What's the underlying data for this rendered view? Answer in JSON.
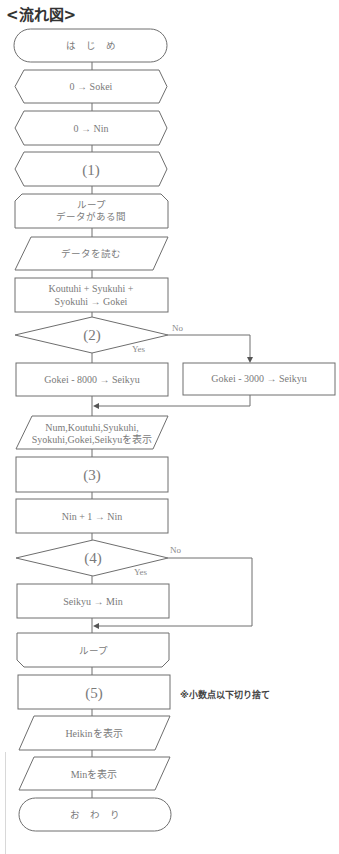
{
  "title": "<流れ図>",
  "nodes": {
    "start": {
      "type": "terminal",
      "label": "は　じ　め"
    },
    "init_sokei": {
      "type": "preparation",
      "label": "0 → Sokei"
    },
    "init_nin": {
      "type": "preparation",
      "label": "0 → Nin"
    },
    "blank1": {
      "type": "preparation",
      "label": "(1)"
    },
    "loop_start": {
      "type": "loop-start",
      "line1": "ループ",
      "line2": "データがある間"
    },
    "read_data": {
      "type": "input",
      "label": "データを読む"
    },
    "sum_gokei": {
      "type": "process",
      "line1": "Koutuhi + Syukuhi +",
      "line2": "Syokuhi → Gokei"
    },
    "blank2": {
      "type": "decision",
      "label": "(2)",
      "yes": "Yes",
      "no": "No"
    },
    "seikyu_8000": {
      "type": "process",
      "label": "Gokei - 8000 → Seikyu"
    },
    "seikyu_3000": {
      "type": "process",
      "label": "Gokei - 3000 → Seikyu"
    },
    "display_record": {
      "type": "output",
      "line1": "Num,Koutuhi,Syukuhi,",
      "line2": "Syokuhi,Gokei,Seikyuを表示"
    },
    "blank3": {
      "type": "process",
      "label": "(3)"
    },
    "inc_nin": {
      "type": "process",
      "label": "Nin + 1 → Nin"
    },
    "blank4": {
      "type": "decision",
      "label": "(4)",
      "yes": "Yes",
      "no": "No"
    },
    "set_min": {
      "type": "process",
      "label": "Seikyu → Min"
    },
    "loop_end": {
      "type": "loop-end",
      "label": "ループ"
    },
    "blank5": {
      "type": "process",
      "label": "(5)",
      "note": "※小数点以下切り捨て"
    },
    "display_heikin": {
      "type": "output",
      "label": "Heikinを表示"
    },
    "display_min": {
      "type": "output",
      "label": "Minを表示"
    },
    "end": {
      "type": "terminal",
      "label": "お　わ　り"
    }
  }
}
